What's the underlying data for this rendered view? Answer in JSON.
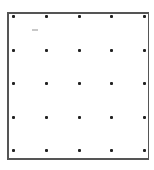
{
  "diagram": {
    "type": "dot-grid",
    "rows": 5,
    "columns": 5,
    "frame_color": "#555555",
    "dot_color": "#222222",
    "column_x": [
      13,
      46,
      79,
      111,
      144
    ],
    "row_y": [
      16,
      50,
      83,
      117,
      150
    ],
    "annotation_mark": {
      "x": 32,
      "y": 29,
      "color": "#c8c8c8"
    }
  }
}
